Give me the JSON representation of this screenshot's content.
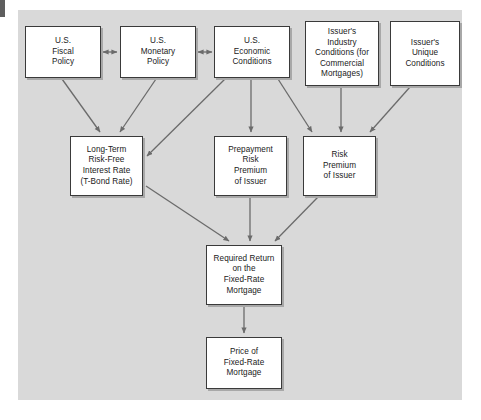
{
  "figure": {
    "type": "flowchart",
    "title": "",
    "panel_color": "#d9d9d9",
    "box_fill": "#ffffff",
    "box_border": "#3a3a3a",
    "arrow_color": "#6b6b6b"
  },
  "nodes": [
    {
      "id": "fiscal",
      "label": "U.S.\nFiscal\nPolicy",
      "x": 25,
      "y": 26,
      "w": 76,
      "h": 52
    },
    {
      "id": "monetary",
      "label": "U.S.\nMonetary\nPolicy",
      "x": 120,
      "y": 26,
      "w": 76,
      "h": 52
    },
    {
      "id": "economic",
      "label": "U.S.\nEconomic\nConditions",
      "x": 214,
      "y": 26,
      "w": 76,
      "h": 52
    },
    {
      "id": "industry",
      "label": "Issuer's\nIndustry\nConditions (for\nCommercial\nMortgages)",
      "x": 305,
      "y": 21,
      "w": 74,
      "h": 65
    },
    {
      "id": "unique",
      "label": "Issuer's\nUnique\nConditions",
      "x": 390,
      "y": 21,
      "w": 70,
      "h": 65
    },
    {
      "id": "longterm",
      "label": "Long-Term\nRisk-Free\nInterest Rate\n(T-Bond Rate)",
      "x": 70,
      "y": 136,
      "w": 73,
      "h": 60
    },
    {
      "id": "prepayment",
      "label": "Prepayment\nRisk\nPremium\nof Issuer",
      "x": 214,
      "y": 136,
      "w": 73,
      "h": 60
    },
    {
      "id": "riskprem",
      "label": "Risk\nPremium\nof Issuer",
      "x": 303,
      "y": 136,
      "w": 73,
      "h": 60
    },
    {
      "id": "required",
      "label": "Required Return\non the\nFixed-Rate\nMortgage",
      "x": 206,
      "y": 245,
      "w": 76,
      "h": 60
    },
    {
      "id": "price",
      "label": "Price of\nFixed-Rate\nMortgage",
      "x": 206,
      "y": 337,
      "w": 76,
      "h": 52
    }
  ],
  "edges": [
    {
      "from": "fiscal",
      "to": "monetary",
      "style": "double-headed"
    },
    {
      "from": "monetary",
      "to": "economic",
      "style": "double-headed"
    },
    {
      "from": "fiscal",
      "to": "longterm",
      "style": "arrow"
    },
    {
      "from": "monetary",
      "to": "longterm",
      "style": "arrow"
    },
    {
      "from": "economic",
      "to": "longterm",
      "style": "arrow"
    },
    {
      "from": "economic",
      "to": "prepayment",
      "style": "arrow"
    },
    {
      "from": "economic",
      "to": "riskprem",
      "style": "arrow"
    },
    {
      "from": "industry",
      "to": "riskprem",
      "style": "arrow"
    },
    {
      "from": "unique",
      "to": "riskprem",
      "style": "arrow"
    },
    {
      "from": "longterm",
      "to": "required",
      "style": "arrow"
    },
    {
      "from": "prepayment",
      "to": "required",
      "style": "arrow"
    },
    {
      "from": "riskprem",
      "to": "required",
      "style": "arrow"
    },
    {
      "from": "required",
      "to": "price",
      "style": "arrow"
    }
  ]
}
